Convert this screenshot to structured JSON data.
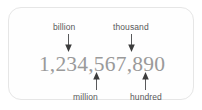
{
  "figure": {
    "number": "1,234,567,890",
    "number_color": "#9a9a9a",
    "border_color": "#e6e6e6",
    "background_color": "#fefefe",
    "label_color": "#58595b",
    "arrow_color": "#58595b"
  },
  "callouts": {
    "top": [
      {
        "label": "billion",
        "arrow": "arrow-down-icon",
        "points_to_digit": "1"
      },
      {
        "label": "thousand",
        "arrow": "arrow-down-icon",
        "points_to_digit": "7"
      }
    ],
    "bottom": [
      {
        "label": "million",
        "arrow": "arrow-up-icon",
        "points_to_digit": "4"
      },
      {
        "label": "hundred",
        "arrow": "arrow-up-icon",
        "points_to_digit": "8"
      }
    ]
  }
}
